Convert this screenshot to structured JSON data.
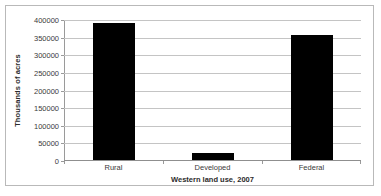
{
  "chart_data": {
    "type": "bar",
    "title": "",
    "xlabel": "Western land use, 2007",
    "ylabel": "Thousands of acres",
    "categories": [
      "Rural",
      "Developed",
      "Federal"
    ],
    "values": [
      388000,
      20000,
      355000
    ],
    "ylim": [
      0,
      400000
    ],
    "yticks": [
      0,
      50000,
      100000,
      150000,
      200000,
      250000,
      300000,
      350000,
      400000
    ],
    "ytick_labels": [
      "0",
      "50000",
      "100000",
      "150000",
      "200000",
      "250000",
      "300000",
      "350000",
      "400000"
    ],
    "grid": true,
    "grid_axis": "y",
    "legend": false,
    "bar_color": "#000000",
    "gridline_color": "#c4c4c4",
    "axis_color": "#8f8f8f",
    "border_color": "#b9b9b9",
    "background": "#ffffff",
    "series": [
      {
        "name": "Western land use, 2007",
        "values": [
          388000,
          20000,
          355000
        ]
      }
    ]
  }
}
